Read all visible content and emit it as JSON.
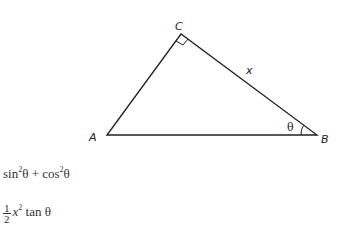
{
  "figure": {
    "vertices": {
      "A": {
        "label": "A",
        "x": 107,
        "y": 135
      },
      "B": {
        "label": "B",
        "x": 317,
        "y": 135
      },
      "C": {
        "label": "C",
        "x": 181,
        "y": 34
      }
    },
    "side_label": "x",
    "angle_label": "θ",
    "right_angle_at": "C"
  },
  "expressions": [
    {
      "parts": {
        "sin": "sin",
        "sq1": "2",
        "theta1": "θ",
        "plus": " + ",
        "cos": "cos",
        "sq2": "2",
        "theta2": "θ"
      }
    },
    {
      "parts": {
        "num": "1",
        "den": "2",
        "x": "x",
        "sq": "2",
        "tan": " tan θ"
      }
    }
  ]
}
